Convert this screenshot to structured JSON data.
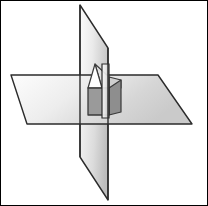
{
  "figure": {
    "canvas": {
      "width": 208,
      "height": 206
    },
    "background_color": "#ffffff",
    "border_color": "#000000",
    "outline_color": "#2b2b2b",
    "outline_width": 1.4
  },
  "palette": {
    "plane_light": "#fdfdfd",
    "plane_mid": "#d8d8d8",
    "plane_dark": "#bdbdbd",
    "vertical_light": "#fbfbfb",
    "vertical_mid": "#c9c9c9",
    "solid_fill": "#9a9a9a",
    "solid_fill_dark": "#8e8e8e",
    "solid_edge": "#3a3a3a",
    "speck": "#333333"
  },
  "shapes": {
    "horizontal_plane": {
      "name": "horizontal-plane",
      "points": "11,75 158,75 192,124 27,124",
      "fill": "gradHorizontal"
    },
    "vertical_plane_upper": {
      "name": "vertical-plane-upper",
      "points": "80,5 108,48 108,110 80,110",
      "fill": "gradVerticalUpper"
    },
    "vertical_plane_lower": {
      "name": "vertical-plane-lower",
      "points": "80,110 108,110 108,200 80,157",
      "fill": "gradVerticalLower"
    },
    "prism_front_face": {
      "name": "prism-front-face",
      "points": "88,88 109,88 109,115 88,115",
      "fill": "#9a9a9a"
    },
    "prism_side_face": {
      "name": "prism-side-face",
      "points": "109,88 121,80 121,112 109,115",
      "fill": "#8e8e8e"
    },
    "prism_roof_left": {
      "name": "prism-roof-left",
      "points": "88,88 95,64 102,88",
      "fill": "#fdfdfd"
    },
    "prism_roof_right": {
      "name": "prism-roof-right",
      "points": "102,88 95,64 109,77 109,88",
      "fill": "#e2e2e2"
    },
    "prism_roof_eave": {
      "name": "prism-roof-eave",
      "points": "109,77 121,80 121,88 109,88",
      "fill": "#cfcfcf"
    },
    "speck": {
      "name": "corner-speck",
      "x": 4,
      "y": 10,
      "width": 2,
      "height": 3
    }
  }
}
